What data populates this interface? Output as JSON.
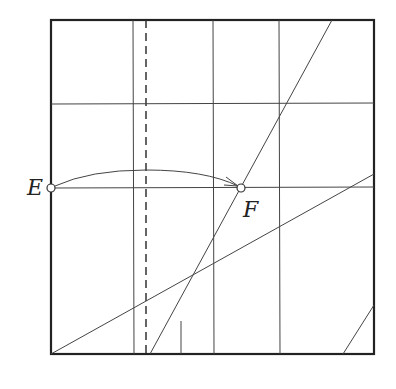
{
  "diagram": {
    "type": "origami crease pattern",
    "labels": {
      "E": "E",
      "F": "F"
    },
    "colors": {
      "line": "#333333",
      "border": "#222222",
      "background": "#ffffff"
    }
  }
}
